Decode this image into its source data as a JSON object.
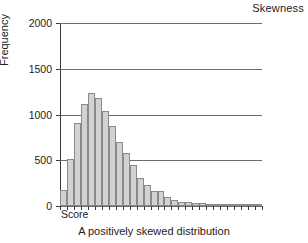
{
  "corner_title": "Skewness",
  "caption": "A positively skewed distribution",
  "axis": {
    "y_title": "Frequency",
    "x_origin_label": "Score"
  },
  "chart_data": {
    "type": "bar",
    "title": "Skewness",
    "subtitle": "A positively skewed distribution",
    "xlabel": "Score",
    "ylabel": "Frequency",
    "ylim": [
      0,
      2000
    ],
    "ytick_labels": [
      "0",
      "500",
      "1000",
      "1500",
      "2000"
    ],
    "ytick_values": [
      0,
      500,
      1000,
      1500,
      2000
    ],
    "grid": true,
    "legend": "none",
    "xtick_labels": [],
    "bar_count": 29,
    "categories": [
      "1",
      "2",
      "3",
      "4",
      "5",
      "6",
      "7",
      "8",
      "9",
      "10",
      "11",
      "12",
      "13",
      "14",
      "15",
      "16",
      "17",
      "18",
      "19",
      "20",
      "21",
      "22",
      "23",
      "24",
      "25",
      "26",
      "27",
      "28",
      "29"
    ],
    "values": [
      170,
      515,
      910,
      1115,
      1230,
      1185,
      1040,
      875,
      700,
      580,
      450,
      310,
      235,
      165,
      165,
      95,
      70,
      45,
      42,
      28,
      30,
      18,
      16,
      12,
      8,
      6,
      4,
      3,
      2
    ]
  }
}
